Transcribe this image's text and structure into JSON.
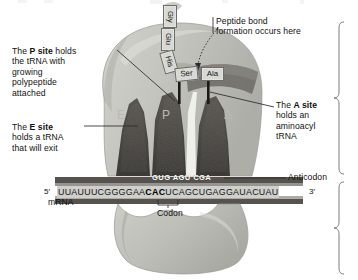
{
  "figure": {
    "type": "ribosome-translation-diagram",
    "palette": {
      "subunit_fill": "#c3c3bd",
      "subunit_edge": "#8e8e88",
      "channel_dark": "#4a4843",
      "mrna_strip": "#cfcfcb",
      "site_letter": "#b9b9b4",
      "text": "#111111",
      "leader_line": "#2b2b2b",
      "background": "#ffffff"
    }
  },
  "callouts": {
    "p_site": "The P site holds\nthe tRNA with\ngrowing\npolypeptide\nattached",
    "p_site_pre": "The ",
    "p_site_bold": "P site",
    "p_site_post": " holds\nthe tRNA with\ngrowing\npolypeptide\nattached",
    "e_site_pre": "The ",
    "e_site_bold": "E site",
    "e_site_post": "\nholds a tRNA\nthat will exit",
    "a_site_pre": "The ",
    "a_site_bold": "A site",
    "a_site_post": "\nholds an\naminoacyl\ntRNA",
    "peptide_bond": "Peptide bond\nformation occurs here",
    "anticodon": "Anticodon",
    "codon": "Codon",
    "mrna": "mRNA"
  },
  "sequence": {
    "five_prime": "5′",
    "three_prime": "3′",
    "mrna_left": "UUAUUUCGGGGAA",
    "mrna_codon": "CAC",
    "mrna_right": "UCAGCUGAGGAUACUAU",
    "mrna_full": "UUAUUUCGGGGAACACUCAGCUGAGGAUACUAU",
    "anticodons": "GUG AGU CGA",
    "anticodon_list": [
      "GUG",
      "AGU",
      "CGA"
    ]
  },
  "sites": {
    "e": "E",
    "p": "P",
    "a": "A"
  },
  "polypeptide": {
    "residues": [
      "Gly",
      "Glu",
      "His",
      "Ser",
      "Ala"
    ],
    "gly": "Gly",
    "glu": "Glu",
    "his": "His",
    "ser": "Ser",
    "ala": "Ala"
  }
}
